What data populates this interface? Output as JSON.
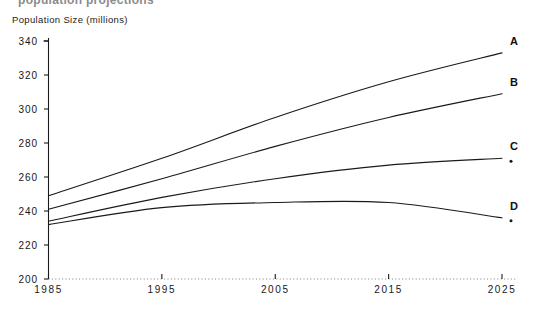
{
  "figure": {
    "clipped_top_title": "population projections",
    "y_axis_title": "Population Size (millions)"
  },
  "chart_data": {
    "type": "line",
    "title": "Population Size (millions)",
    "xlabel": "",
    "ylabel": "Population Size (millions)",
    "x": [
      1985,
      1995,
      2005,
      2015,
      2025
    ],
    "xlim": [
      1985,
      2025
    ],
    "ylim": [
      200,
      340
    ],
    "xticks": [
      "1985",
      "1995",
      "2005",
      "2015",
      "2025"
    ],
    "yticks": [
      "200",
      "220",
      "240",
      "260",
      "280",
      "300",
      "320",
      "340"
    ],
    "grid": false,
    "legend_position": "right-end-labels",
    "series": [
      {
        "name": "A",
        "label": "A",
        "color": "#1a1a1a",
        "values": [
          249,
          271,
          295,
          316,
          333
        ]
      },
      {
        "name": "B",
        "label": "B",
        "color": "#1a1a1a",
        "values": [
          241,
          259,
          278,
          295,
          309
        ]
      },
      {
        "name": "C",
        "label": "C",
        "color": "#1a1a1a",
        "values": [
          234,
          248,
          259,
          267,
          271
        ]
      },
      {
        "name": "D",
        "label": "D",
        "color": "#1a1a1a",
        "values": [
          232,
          242,
          245,
          245,
          236
        ]
      }
    ]
  },
  "axes": {
    "y_tick_labels": [
      "340",
      "320",
      "300",
      "280",
      "260",
      "240",
      "220",
      "200"
    ],
    "x_tick_labels": [
      "1985",
      "1995",
      "2005",
      "2015",
      "2025"
    ]
  },
  "series_end_labels": [
    "A",
    "B",
    "C",
    "D"
  ],
  "colors": {
    "line": "#1a1a1a",
    "axis": "#1a1a1a",
    "background": "#ffffff",
    "text": "#171717"
  }
}
